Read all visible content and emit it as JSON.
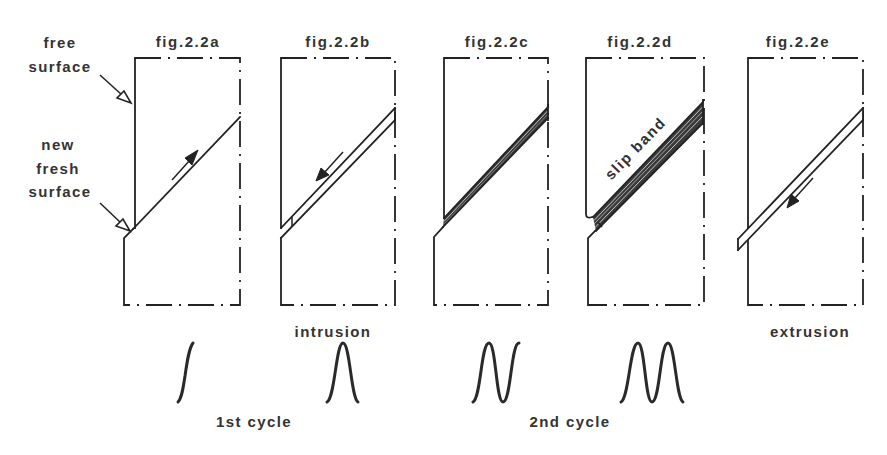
{
  "diagram": {
    "annotations": {
      "free_surface": [
        "free",
        "surface"
      ],
      "new_fresh_surface": [
        "new",
        "fresh",
        "surface"
      ]
    },
    "panels": [
      {
        "id": "a",
        "title": "fig.2.2a",
        "slip_arrow": "up-right-arrow"
      },
      {
        "id": "b",
        "title": "fig.2.2b",
        "slip_arrow": "down-left-arrow"
      },
      {
        "id": "c",
        "title": "fig.2.2c"
      },
      {
        "id": "d",
        "title": "fig.2.2d"
      },
      {
        "id": "e",
        "title": "fig.2.2e",
        "slip_arrow": "down-left-arrow"
      }
    ],
    "slip_band_label": "slip band",
    "process_labels": {
      "intrusion": "intrusion",
      "extrusion": "extrusion"
    },
    "cycle_labels": {
      "first": "1st cycle",
      "second": "2nd cycle"
    },
    "waveforms": [
      "half-rise",
      "single-peak",
      "peak-and-rise",
      "double-peak"
    ],
    "colors": {
      "line": "#222222",
      "text": "#333333",
      "background": "#ffffff"
    }
  }
}
